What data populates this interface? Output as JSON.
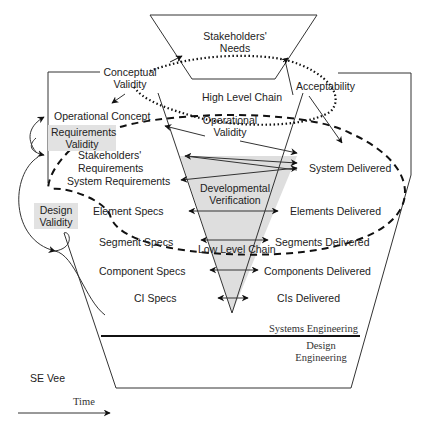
{
  "diagram": {
    "title": "SE Vee",
    "time_axis_label": "Time",
    "top_box": {
      "line1": "Stakeholders'",
      "line2": "Needs"
    },
    "chains": {
      "high": "High Level Chain",
      "low": "Low Level Chain"
    },
    "validity": {
      "conceptual": {
        "line1": "Conceptual",
        "line2": "Validity"
      },
      "acceptability": "Acceptability",
      "operational": {
        "line1": "Operational",
        "line2": "Validity"
      },
      "requirements": {
        "line1": "Requirements",
        "line2": "Validity"
      },
      "design": {
        "line1": "Design",
        "line2": "Validity"
      }
    },
    "verification": {
      "line1": "Developmental",
      "line2": "Verification"
    },
    "left_levels": [
      "Operational Concept",
      "Stakeholders'",
      "Requirements",
      "System Requirements",
      "Element Specs",
      "Segment Specs",
      "Component Specs",
      "CI Specs"
    ],
    "right_levels": [
      "System Delivered",
      "Elements Delivered",
      "Segments Delivered",
      "Components Delivered",
      "CIs Delivered"
    ],
    "bands": {
      "upper": "Systems Engineering",
      "lower_line1": "Design",
      "lower_line2": "Engineering"
    },
    "colors": {
      "line": "#333333",
      "shade": "#dedede",
      "label_shade": "#e2e2e2"
    }
  }
}
